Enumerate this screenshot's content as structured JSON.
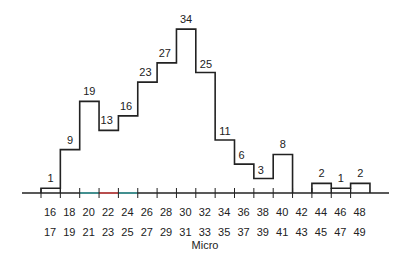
{
  "chart_data": {
    "type": "bar",
    "subtype": "histogram-step",
    "title": "",
    "xlabel": "Micro",
    "ylabel": "",
    "grid": false,
    "legend": null,
    "bin_labels_top": [
      "16",
      "18",
      "20",
      "22",
      "24",
      "26",
      "28",
      "30",
      "32",
      "34",
      "36",
      "38",
      "40",
      "42",
      "44",
      "46",
      "48"
    ],
    "bin_labels_bottom": [
      "17",
      "19",
      "21",
      "23",
      "25",
      "27",
      "29",
      "31",
      "33",
      "35",
      "37",
      "39",
      "41",
      "43",
      "45",
      "47",
      "49"
    ],
    "categories": [
      "16-17",
      "18-19",
      "20-21",
      "22-23",
      "24-25",
      "26-27",
      "28-29",
      "30-31",
      "32-33",
      "34-35",
      "36-37",
      "38-39",
      "40-41",
      "42-43",
      "44-45",
      "46-47",
      "48-49"
    ],
    "values": [
      1,
      9,
      19,
      13,
      16,
      23,
      27,
      34,
      25,
      11,
      6,
      3,
      8,
      0,
      2,
      1,
      2
    ],
    "data_labels": [
      "1",
      "9",
      "19",
      "13",
      "16",
      "23",
      "27",
      "34",
      "25",
      "11",
      "6",
      "3",
      "8",
      "",
      "2",
      "1",
      "2"
    ],
    "ylim": [
      0,
      34
    ],
    "axis_highlights": [
      {
        "from": "20",
        "to": "22",
        "color": "#3aa6a6"
      },
      {
        "from": "22",
        "to": "24",
        "color": "#e04a4a"
      },
      {
        "from": "24",
        "to": "26",
        "color": "#3aa6a6"
      }
    ],
    "highlighted_bottom_label": {
      "label": "23",
      "color": "#e04a4a"
    }
  }
}
